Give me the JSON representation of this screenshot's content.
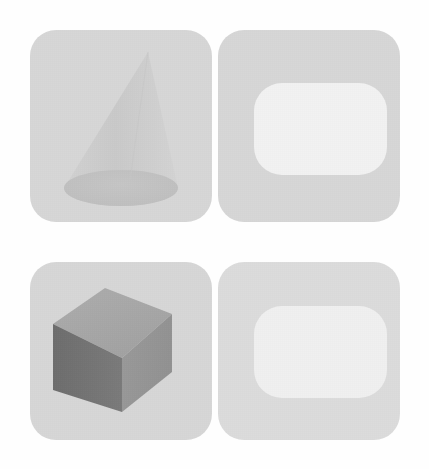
{
  "canvas": {
    "width": 429,
    "height": 469,
    "background_color": "#fefefe",
    "layout": "2x2-grid"
  },
  "palette": {
    "panel_fill": "#d7d7d7",
    "panel_fill_light": "#dcdcdc",
    "plate_fill": "#f2f2f2",
    "plate_fill_alt": "#f0f0f0",
    "cone_body": "#cfcfcf",
    "cone_base": "#c3c3c3",
    "cube_top": "#a8a8a8",
    "cube_left": "#737373",
    "cube_right": "#969696",
    "page_background": "#fefefe"
  },
  "panels": [
    {
      "id": "top-left",
      "name": "cone-panel",
      "shape": "cone",
      "shape_label": "cone",
      "has_plate": false,
      "x": 30,
      "y": 30,
      "width": 182,
      "height": 192,
      "corner_radius": 26,
      "fill": "#d7d7d7"
    },
    {
      "id": "top-right",
      "name": "plate-panel-top",
      "shape": "rounded-plate",
      "shape_label": "rounded rectangle plate",
      "has_plate": true,
      "x": 218,
      "y": 30,
      "width": 182,
      "height": 192,
      "corner_radius": 26,
      "fill": "#d7d7d7",
      "plate_fill": "#f2f2f2"
    },
    {
      "id": "bottom-left",
      "name": "cube-panel",
      "shape": "cube",
      "shape_label": "cube",
      "has_plate": false,
      "x": 30,
      "y": 262,
      "width": 182,
      "height": 178,
      "corner_radius": 26,
      "fill": "#d7d7d7"
    },
    {
      "id": "bottom-right",
      "name": "plate-panel-bottom",
      "shape": "rounded-plate",
      "shape_label": "rounded rectangle plate",
      "has_plate": true,
      "x": 218,
      "y": 262,
      "width": 182,
      "height": 178,
      "corner_radius": 26,
      "fill": "#dcdcdc",
      "plate_fill": "#f0f0f0"
    }
  ],
  "cone": {
    "apex_x": 118,
    "apex_y": 22,
    "base_center_x": 91,
    "base_center_y": 158,
    "base_rx": 57,
    "base_ry": 18,
    "body_fill": "#cfcfcf",
    "base_fill": "#c3c3c3"
  },
  "cube": {
    "top_face_fill": "#a8a8a8",
    "left_face_fill": "#737373",
    "right_face_fill": "#969696",
    "top_points": "23,62 75,26 142,52 92,96",
    "left_points": "23,62 92,96 92,150 23,128",
    "right_points": "92,96 142,52 142,110 92,150"
  }
}
